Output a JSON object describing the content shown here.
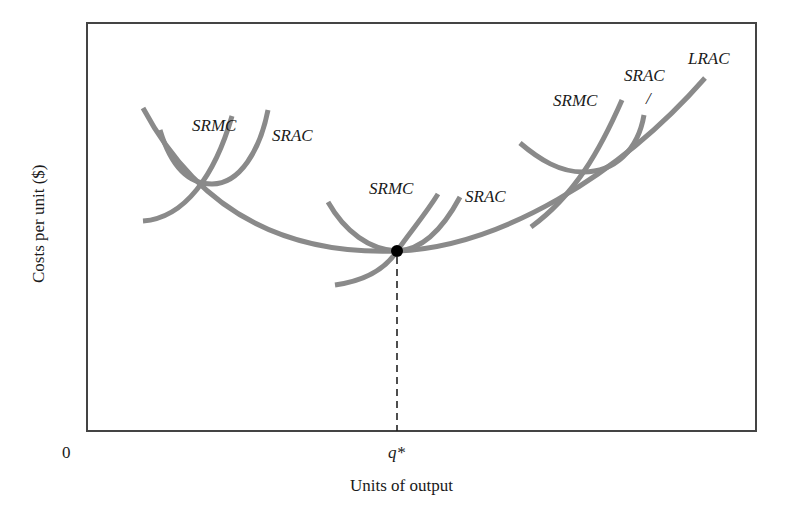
{
  "diagram": {
    "title": "",
    "axes": {
      "x_label": "Units of output",
      "y_label": "Costs per unit ($)",
      "origin_label": "0",
      "x_tick_label": "q*"
    },
    "colors": {
      "curve": "#8a8a8a",
      "frame": "#444444",
      "point": "#000000",
      "text": "#1a1a1a"
    },
    "curves": [
      {
        "id": "lrac",
        "label": "LRAC",
        "description": "Long-run average cost, U-shaped envelope"
      },
      {
        "id": "srac-1",
        "label": "SRAC",
        "description": "Short-run average cost, small plant"
      },
      {
        "id": "srmc-1",
        "label": "SRMC",
        "description": "Short-run marginal cost, small plant"
      },
      {
        "id": "srac-2",
        "label": "SRAC",
        "description": "Short-run average cost, optimal plant tangent at LRAC minimum"
      },
      {
        "id": "srmc-2",
        "label": "SRMC",
        "description": "Short-run marginal cost, optimal plant"
      },
      {
        "id": "srac-3",
        "label": "SRAC",
        "description": "Short-run average cost, large plant"
      },
      {
        "id": "srmc-3",
        "label": "SRMC",
        "description": "Short-run marginal cost, large plant"
      }
    ],
    "labels": {
      "srmc_1": "SRMC",
      "srac_1": "SRAC",
      "srmc_2": "SRMC",
      "srac_2": "SRAC",
      "srmc_3": "SRMC",
      "srac_3": "SRAC",
      "srac_3_pointer": "/",
      "lrac": "LRAC"
    },
    "point": {
      "label": "Minimum efficient scale",
      "at": "q*"
    }
  }
}
